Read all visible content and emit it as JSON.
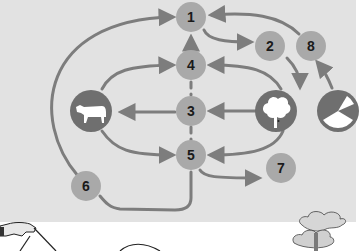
{
  "diagram": {
    "type": "cycle-flow",
    "nodes": [
      {
        "id": "1",
        "label": "1"
      },
      {
        "id": "2",
        "label": "2"
      },
      {
        "id": "3",
        "label": "3"
      },
      {
        "id": "4",
        "label": "4"
      },
      {
        "id": "5",
        "label": "5"
      },
      {
        "id": "6",
        "label": "6"
      },
      {
        "id": "7",
        "label": "7"
      },
      {
        "id": "8",
        "label": "8"
      }
    ],
    "icons": [
      {
        "id": "cow",
        "name": "cow-icon"
      },
      {
        "id": "tree",
        "name": "tree-icon"
      },
      {
        "id": "pie",
        "name": "pie-chart-icon"
      }
    ],
    "edges": [
      {
        "from": "6",
        "to": "1"
      },
      {
        "from": "cow",
        "to": "4"
      },
      {
        "from": "3",
        "to": "cow"
      },
      {
        "from": "cow",
        "to": "5"
      },
      {
        "from": "4",
        "to": "1"
      },
      {
        "from": "1",
        "to": "2"
      },
      {
        "from": "8",
        "to": "1"
      },
      {
        "from": "2",
        "to": "tree"
      },
      {
        "from": "tree",
        "to": "4"
      },
      {
        "from": "tree",
        "to": "3"
      },
      {
        "from": "tree",
        "to": "5"
      },
      {
        "from": "pie",
        "to": "8"
      },
      {
        "from": "5",
        "to": "7"
      },
      {
        "from": "5",
        "to": "6"
      }
    ],
    "colors": {
      "panel": "#e2e2e2",
      "node": "#a9a9a9",
      "arrow": "#7d7d7d",
      "icon_bg": "#6f6f6f"
    }
  }
}
